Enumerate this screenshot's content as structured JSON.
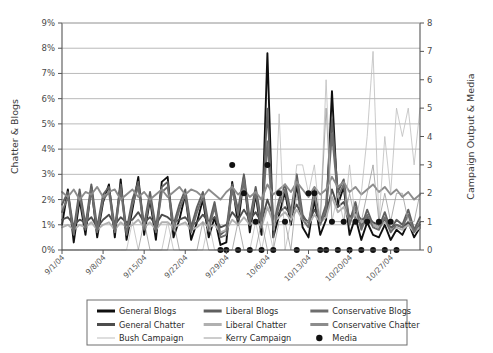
{
  "chart_data": {
    "type": "line",
    "title": "",
    "xlabel": "",
    "ylabel": "Chatter & Blogs",
    "y2label": "Campaign Output & Media",
    "ylim": [
      0,
      9
    ],
    "y2lim": [
      0,
      8
    ],
    "ytick_labels": [
      "0%",
      "1%",
      "2%",
      "3%",
      "4%",
      "5%",
      "6%",
      "7%",
      "8%",
      "9%"
    ],
    "ytick_values": [
      0,
      1,
      2,
      3,
      4,
      5,
      6,
      7,
      8,
      9
    ],
    "y2tick_labels": [
      "0",
      "1",
      "2",
      "3",
      "4",
      "5",
      "6",
      "7",
      "8"
    ],
    "y2tick_values": [
      0,
      1,
      2,
      3,
      4,
      5,
      6,
      7,
      8
    ],
    "grid": true,
    "legend_position": "bottom",
    "xtick_labels": [
      "9/1/04",
      "9/8/04",
      "9/15/04",
      "9/22/04",
      "9/29/04",
      "10/6/04",
      "10/13/04",
      "10/20/04",
      "10/27/04"
    ],
    "xtick_indices": [
      0,
      7,
      14,
      21,
      28,
      35,
      42,
      49,
      56
    ],
    "n_points": 62,
    "series": [
      {
        "name": "General Blogs",
        "axis": "left",
        "color": "#101010",
        "width": 1.9,
        "values": [
          1.0,
          2.4,
          0.3,
          2.0,
          0.6,
          2.5,
          0.5,
          1.9,
          2.6,
          0.5,
          2.8,
          0.4,
          1.6,
          2.9,
          0.6,
          2.0,
          0.4,
          2.7,
          2.9,
          0.5,
          1.2,
          2.2,
          0.4,
          1.1,
          2.0,
          0.5,
          1.3,
          0.2,
          0.3,
          2.7,
          1.0,
          2.9,
          0.7,
          2.2,
          0.6,
          7.8,
          0.5,
          1.4,
          2.3,
          1.0,
          2.6,
          0.9,
          0.5,
          2.0,
          0.6,
          1.2,
          6.3,
          1.8,
          2.5,
          0.6,
          1.3,
          0.4,
          1.1,
          0.6,
          0.5,
          1.0,
          0.4,
          0.8,
          0.6,
          1.1,
          0.5,
          0.9
        ]
      },
      {
        "name": "General Chatter",
        "axis": "left",
        "color": "#4d4d4d",
        "width": 1.9,
        "values": [
          1.2,
          1.3,
          1.0,
          1.2,
          1.1,
          1.3,
          0.9,
          1.2,
          1.4,
          1.0,
          1.3,
          1.1,
          1.2,
          1.5,
          1.1,
          1.3,
          1.0,
          1.4,
          1.3,
          1.1,
          1.2,
          1.3,
          1.0,
          1.1,
          1.4,
          1.1,
          1.3,
          0.9,
          1.0,
          1.5,
          1.2,
          1.6,
          1.2,
          1.5,
          1.1,
          2.0,
          1.3,
          1.5,
          1.7,
          1.4,
          1.8,
          1.3,
          1.1,
          1.6,
          1.2,
          1.4,
          2.4,
          1.7,
          1.9,
          1.3,
          1.5,
          1.2,
          1.3,
          1.1,
          1.0,
          1.2,
          0.9,
          1.0,
          0.9,
          1.1,
          0.8,
          1.0
        ]
      },
      {
        "name": "Liberal Blogs",
        "axis": "left",
        "color": "#5f5f5f",
        "width": 1.9,
        "values": [
          1.8,
          2.3,
          0.8,
          2.4,
          1.0,
          2.6,
          0.9,
          2.2,
          2.5,
          0.9,
          2.6,
          0.8,
          2.0,
          2.7,
          1.0,
          2.3,
          0.9,
          2.5,
          2.7,
          1.0,
          1.8,
          2.4,
          0.9,
          1.7,
          2.3,
          1.0,
          1.9,
          0.6,
          0.8,
          2.6,
          1.6,
          3.0,
          1.2,
          2.5,
          1.1,
          5.6,
          1.0,
          2.0,
          2.6,
          1.5,
          3.0,
          1.4,
          1.0,
          2.4,
          1.1,
          1.8,
          5.2,
          2.3,
          2.8,
          1.1,
          1.9,
          0.9,
          1.6,
          1.0,
          0.9,
          1.5,
          0.8,
          1.2,
          1.0,
          1.6,
          0.8,
          1.3
        ]
      },
      {
        "name": "Liberal Chatter",
        "axis": "left",
        "color": "#b0b0b0",
        "width": 1.9,
        "values": [
          0.9,
          1.0,
          0.8,
          1.0,
          0.9,
          1.1,
          0.8,
          1.0,
          1.1,
          0.8,
          1.1,
          0.9,
          1.0,
          1.2,
          0.9,
          1.1,
          0.8,
          1.1,
          1.1,
          0.9,
          1.0,
          1.1,
          0.8,
          0.9,
          1.1,
          0.9,
          1.0,
          0.7,
          0.8,
          1.2,
          1.0,
          1.3,
          1.0,
          1.2,
          0.9,
          1.7,
          1.1,
          1.3,
          1.5,
          1.2,
          1.6,
          1.2,
          1.0,
          1.4,
          1.1,
          1.3,
          2.1,
          1.5,
          1.7,
          1.2,
          1.4,
          1.1,
          1.2,
          1.0,
          0.9,
          1.1,
          0.8,
          0.9,
          0.8,
          1.0,
          0.7,
          0.9
        ]
      },
      {
        "name": "Conservative Blogs",
        "axis": "left",
        "color": "#6e6e6e",
        "width": 1.9,
        "values": [
          1.5,
          2.1,
          0.6,
          2.2,
          0.8,
          2.4,
          0.7,
          2.0,
          2.3,
          0.7,
          2.4,
          0.6,
          1.8,
          2.5,
          0.8,
          2.1,
          0.7,
          2.3,
          2.5,
          0.8,
          1.6,
          2.2,
          0.7,
          1.5,
          2.1,
          0.8,
          1.7,
          0.5,
          0.6,
          2.4,
          1.4,
          2.8,
          1.0,
          2.3,
          0.9,
          4.3,
          0.8,
          1.8,
          2.4,
          1.3,
          2.8,
          1.2,
          0.9,
          2.2,
          1.0,
          1.6,
          4.6,
          2.1,
          2.6,
          1.0,
          1.7,
          0.8,
          1.4,
          0.9,
          0.8,
          1.3,
          0.7,
          1.0,
          0.9,
          1.4,
          0.7,
          1.1
        ]
      },
      {
        "name": "Conservative Chatter",
        "axis": "left",
        "color": "#8c8c8c",
        "width": 1.9,
        "values": [
          2.3,
          2.1,
          2.4,
          2.0,
          2.3,
          2.2,
          2.5,
          2.1,
          2.3,
          2.4,
          2.0,
          2.2,
          2.4,
          2.1,
          2.3,
          2.0,
          2.2,
          2.4,
          2.1,
          2.3,
          2.5,
          2.2,
          2.4,
          2.3,
          2.1,
          2.4,
          2.2,
          2.0,
          2.3,
          2.5,
          2.2,
          2.4,
          2.1,
          2.3,
          2.0,
          2.6,
          2.2,
          2.4,
          2.6,
          2.3,
          2.7,
          2.4,
          2.1,
          2.5,
          2.2,
          2.4,
          2.9,
          2.5,
          2.7,
          2.3,
          2.5,
          2.2,
          2.4,
          2.6,
          2.3,
          2.5,
          2.2,
          2.4,
          2.1,
          2.3,
          2.0,
          2.2
        ]
      },
      {
        "name": "Bush Campaign",
        "axis": "right",
        "color": "#bdbdbd",
        "width": 0.8,
        "values": [
          0,
          0,
          0,
          0,
          0,
          0,
          0,
          0,
          0,
          0,
          0,
          0,
          1.0,
          0,
          0,
          0,
          0,
          0,
          1.0,
          0,
          0,
          0,
          0,
          0,
          0,
          1.0,
          0,
          0,
          0,
          0,
          0,
          0,
          0,
          1.0,
          0,
          1.0,
          0,
          4.8,
          0,
          1.0,
          3.0,
          3.0,
          2.0,
          3.0,
          1.0,
          6.0,
          1.0,
          2.0,
          1.0,
          3.0,
          1.0,
          2.0,
          4.0,
          7.0,
          1.0,
          4.0,
          2.0,
          5.0,
          4.0,
          5.0,
          3.0,
          5.0
        ]
      },
      {
        "name": "Kerry Campaign",
        "axis": "right",
        "color": "#9a9a9a",
        "width": 0.8,
        "values": [
          0,
          0,
          0,
          0,
          0,
          0,
          0,
          0,
          0,
          0,
          0,
          0,
          0,
          0,
          1.0,
          0,
          0,
          0,
          0,
          1.0,
          0,
          0,
          0,
          0,
          1.0,
          0,
          0,
          0,
          0,
          0,
          1.0,
          0,
          0,
          0,
          1.0,
          0,
          0,
          1.0,
          1.0,
          0,
          2.0,
          1.0,
          1.0,
          2.0,
          1.0,
          5.0,
          1.0,
          1.0,
          1.0,
          2.0,
          1.0,
          1.0,
          2.0,
          3.0,
          1.0,
          2.0,
          1.0,
          2.0,
          2.0,
          1.0,
          1.0,
          2.0
        ]
      },
      {
        "name": "Media",
        "axis": "right",
        "color": "#111111",
        "type": "scatter",
        "marker": "circle",
        "points": [
          {
            "x": 27,
            "y": 0
          },
          {
            "x": 28,
            "y": 0
          },
          {
            "x": 29,
            "y": 3.0
          },
          {
            "x": 30,
            "y": 0
          },
          {
            "x": 31,
            "y": 2.0
          },
          {
            "x": 32,
            "y": 0
          },
          {
            "x": 33,
            "y": 1.0
          },
          {
            "x": 34,
            "y": 0
          },
          {
            "x": 35,
            "y": 3.0
          },
          {
            "x": 36,
            "y": 0
          },
          {
            "x": 37,
            "y": 2.0
          },
          {
            "x": 38,
            "y": 1.0
          },
          {
            "x": 40,
            "y": 0
          },
          {
            "x": 42,
            "y": 2.0
          },
          {
            "x": 43,
            "y": 2.0
          },
          {
            "x": 44,
            "y": 0
          },
          {
            "x": 45,
            "y": 0
          },
          {
            "x": 46,
            "y": 1.0
          },
          {
            "x": 47,
            "y": 0
          },
          {
            "x": 48,
            "y": 1.0
          },
          {
            "x": 49,
            "y": 0
          },
          {
            "x": 50,
            "y": 1.0
          },
          {
            "x": 51,
            "y": 0
          },
          {
            "x": 52,
            "y": 1.0
          },
          {
            "x": 53,
            "y": 0
          },
          {
            "x": 54,
            "y": 1.0
          },
          {
            "x": 55,
            "y": 0
          },
          {
            "x": 56,
            "y": 1.0
          },
          {
            "x": 57,
            "y": 0
          }
        ]
      }
    ]
  },
  "legend": {
    "entries": [
      {
        "label": "General Blogs",
        "color": "#101010",
        "width": 3.0,
        "marker": "line"
      },
      {
        "label": "Liberal Blogs",
        "color": "#5f5f5f",
        "width": 3.0,
        "marker": "line"
      },
      {
        "label": "Conservative Blogs",
        "color": "#6e6e6e",
        "width": 3.0,
        "marker": "line"
      },
      {
        "label": "General Chatter",
        "color": "#4d4d4d",
        "width": 3.0,
        "marker": "line"
      },
      {
        "label": "Liberal Chatter",
        "color": "#b0b0b0",
        "width": 3.0,
        "marker": "line"
      },
      {
        "label": "Conservative Chatter",
        "color": "#8c8c8c",
        "width": 3.0,
        "marker": "line"
      },
      {
        "label": "Bush Campaign",
        "color": "#bdbdbd",
        "width": 1.0,
        "marker": "line"
      },
      {
        "label": "Kerry Campaign",
        "color": "#9a9a9a",
        "width": 1.0,
        "marker": "line"
      },
      {
        "label": "Media",
        "color": "#111111",
        "width": 0,
        "marker": "dot"
      }
    ]
  },
  "colors": {
    "grid": "#a8a8a8",
    "axis": "#555555",
    "legend_border": "#6e6e6e",
    "background": "#ffffff"
  }
}
